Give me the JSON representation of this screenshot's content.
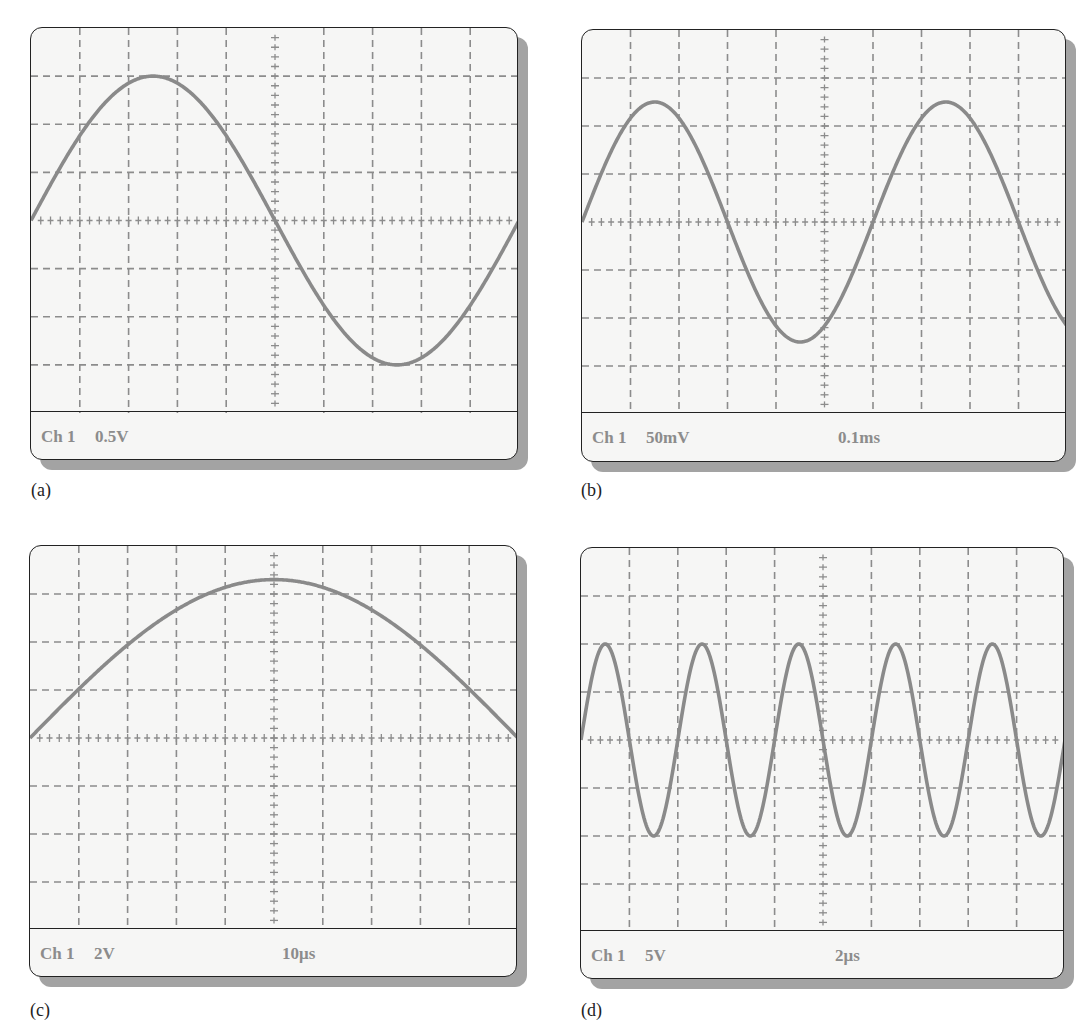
{
  "figure": {
    "panels": [
      {
        "id": "a",
        "caption": "(a)",
        "channel": "Ch 1",
        "volts_per_div": "0.5V",
        "time_per_div": ""
      },
      {
        "id": "b",
        "caption": "(b)",
        "channel": "Ch 1",
        "volts_per_div": "50mV",
        "time_per_div": "0.1ms"
      },
      {
        "id": "c",
        "caption": "(c)",
        "channel": "Ch 1",
        "volts_per_div": "2V",
        "time_per_div": "10μs"
      },
      {
        "id": "d",
        "caption": "(d)",
        "channel": "Ch 1",
        "volts_per_div": "5V",
        "time_per_div": "2μs"
      }
    ]
  },
  "colors": {
    "trace": "#8a8a8a",
    "grid": "#8c8c8c",
    "screen_bg": "#f6f6f5",
    "border": "#222222",
    "shadow": "#a3a3a3",
    "readout_text": "#8c8c8c"
  },
  "chart_data": [
    {
      "type": "line",
      "title": "(a) Oscilloscope display",
      "channel": "Ch 1",
      "volts_per_div": 0.5,
      "time_per_div": null,
      "grid": {
        "x_divisions": 10,
        "y_divisions": 8,
        "minor_ticks_per_div": 5
      },
      "waveform": {
        "shape": "sine",
        "amplitude_div": 3,
        "period_div": 10,
        "phase_deg": 0
      },
      "derived": {
        "peak_voltage_V": 1.5,
        "peak_to_peak_V": 3.0
      }
    },
    {
      "type": "line",
      "title": "(b) Oscilloscope display",
      "channel": "Ch 1",
      "volts_per_div": 0.05,
      "time_per_div": 0.0001,
      "grid": {
        "x_divisions": 10,
        "y_divisions": 8,
        "minor_ticks_per_div": 5
      },
      "waveform": {
        "shape": "sine",
        "amplitude_div": 2.5,
        "period_div": 6,
        "phase_deg": 0
      },
      "derived": {
        "peak_voltage_mV": 125,
        "period_ms": 0.6,
        "frequency_Hz": 1667
      }
    },
    {
      "type": "line",
      "title": "(c) Oscilloscope display",
      "channel": "Ch 1",
      "volts_per_div": 2,
      "time_per_div": 1e-05,
      "grid": {
        "x_divisions": 10,
        "y_divisions": 8,
        "minor_ticks_per_div": 5
      },
      "waveform": {
        "shape": "sine",
        "amplitude_div": 3.3,
        "period_div": 20,
        "phase_deg": 0
      },
      "derived": {
        "peak_voltage_V": 6.6,
        "period_us": 200,
        "frequency_kHz": 5
      }
    },
    {
      "type": "line",
      "title": "(d) Oscilloscope display",
      "channel": "Ch 1",
      "volts_per_div": 5,
      "time_per_div": 2e-06,
      "grid": {
        "x_divisions": 10,
        "y_divisions": 8,
        "minor_ticks_per_div": 5
      },
      "waveform": {
        "shape": "sine",
        "amplitude_div": 2,
        "period_div": 2,
        "phase_deg": 0
      },
      "derived": {
        "peak_voltage_V": 10,
        "period_us": 4,
        "frequency_kHz": 250
      }
    }
  ]
}
